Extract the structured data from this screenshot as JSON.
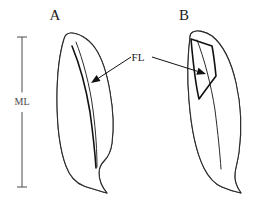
{
  "figure": {
    "type": "muscle-architecture-diagram",
    "background_color": "#ffffff",
    "ink_color": "#2b2b2b",
    "width": 254,
    "height": 215
  },
  "scale_bar": {
    "label": "ML",
    "label_meaning": "muscle length",
    "x": 22,
    "top_y": 37,
    "bottom_y": 187,
    "cap_half_width": 5,
    "color": "#4a4a4a"
  },
  "panels": [
    {
      "id": "A",
      "label": "A",
      "label_x": 55,
      "label_y": 20,
      "description": "long narrow pennate muscle with long fascicles and small pennation angle",
      "hatch_angle_deg": 8,
      "hatch_spacing": 2.2,
      "outline_path": "M 64 39 C 60 52 57 74 57 99 C 57 124 60 150 66 166 C 70 177 76 183 84 186 C 92 189 100 191 107 193 C 101 186 99 180 99 173 C 99 168 101 164 104 161 C 108 157 111 151 112 143 C 114 128 113 109 110 92 C 107 74 102 58 95 48 C 88 38 78 33 71 33 C 67 33 65 35 64 39 Z",
      "tendon_path": "M 76 42 C 83 60 90 86 93 110 C 96 133 97 152 97 167",
      "fascicle_path": "M 72 46 C 79 63 86 88 90 112 C 93 134 95 153 96 168",
      "fl_arrow": {
        "from_x": 131,
        "from_y": 57,
        "to_x": 91,
        "to_y": 83
      }
    },
    {
      "id": "B",
      "label": "B",
      "label_x": 184,
      "label_y": 20,
      "description": "wider pennate muscle with short fascicles and large pennation angle",
      "hatch_angle_deg": 32,
      "hatch_spacing": 3.4,
      "outline_path": "M 190 37 C 188 53 187 76 189 100 C 191 126 196 152 204 168 C 209 178 215 184 222 187 C 229 190 236 192 241 193 C 236 186 234 180 235 173 C 236 166 238 160 239 152 C 242 130 241 105 236 83 C 231 61 222 44 212 36 C 205 31 197 30 193 32 C 191 33 190 35 190 37 Z",
      "tendon_path": "M 197 40 C 204 58 211 84 215 110 C 218 134 220 154 221 169",
      "fascicle_path": "M 191 39 L 212 46 C 214 56 215 66 216 76 C 210 84 204 92 199 99 C 196 86 193 62 191 39 Z",
      "fl_arrow": {
        "from_x": 152,
        "from_y": 57,
        "to_x": 206,
        "to_y": 74
      }
    }
  ],
  "annotations": {
    "fl_label": "FL",
    "fl_label_meaning": "fascicle length",
    "fl_label_x": 138,
    "fl_label_y": 61
  }
}
